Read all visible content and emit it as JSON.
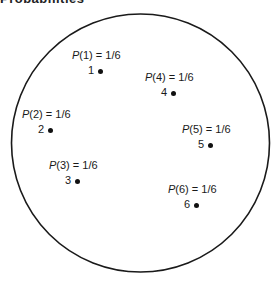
{
  "title": "Probabilities",
  "diagram": {
    "shape": "circle",
    "outcomes": [
      {
        "label": "1",
        "prob_var": "P",
        "prob_arg": "(1)",
        "prob_value": "= 1/6",
        "x": 100,
        "y": 71
      },
      {
        "label": "2",
        "prob_var": "P",
        "prob_arg": "(2)",
        "prob_value": "= 1/6",
        "x": 50,
        "y": 130
      },
      {
        "label": "3",
        "prob_var": "P",
        "prob_arg": "(3)",
        "prob_value": "= 1/6",
        "x": 77,
        "y": 181
      },
      {
        "label": "4",
        "prob_var": "P",
        "prob_arg": "(4)",
        "prob_value": "= 1/6",
        "x": 173,
        "y": 93
      },
      {
        "label": "5",
        "prob_var": "P",
        "prob_arg": "(5)",
        "prob_value": "= 1/6",
        "x": 210,
        "y": 145
      },
      {
        "label": "6",
        "prob_var": "P",
        "prob_arg": "(6)",
        "prob_value": "= 1/6",
        "x": 196,
        "y": 205
      }
    ]
  }
}
